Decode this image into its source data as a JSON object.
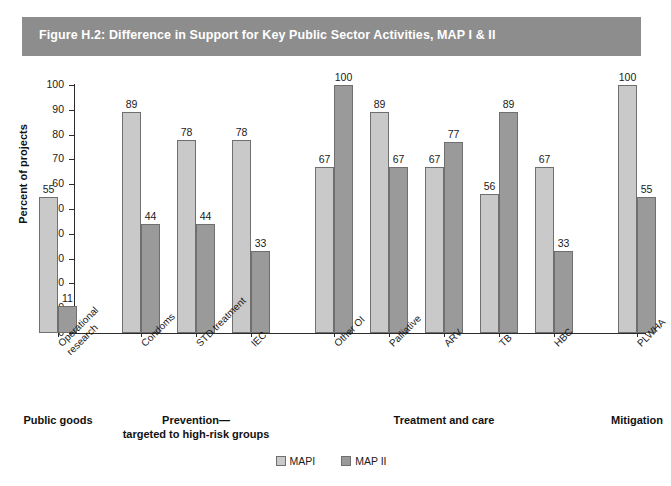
{
  "figure": {
    "title": "Figure H.2: Difference in Support for Key Public Sector Activities, MAP I & II",
    "band_color": "#8d8d8d",
    "title_color": "#ffffff"
  },
  "chart_data": {
    "type": "bar",
    "title": "Figure H.2: Difference in Support for Key Public Sector Activities, MAP I & II",
    "xlabel": "",
    "ylabel": "Percent of projects",
    "ylim": [
      0,
      100
    ],
    "yticks": [
      0,
      10,
      20,
      30,
      40,
      50,
      60,
      70,
      80,
      90,
      100
    ],
    "grid": false,
    "legend_position": "bottom-center",
    "categories": [
      "Operational research",
      "Condoms",
      "STD treatment",
      "IEC",
      "Other OI",
      "Palliative",
      "ARV",
      "TB",
      "HBC",
      "PLWHA"
    ],
    "series": [
      {
        "name": "MAPI",
        "color": "#c9c9c9",
        "values": [
          55,
          89,
          78,
          78,
          67,
          89,
          67,
          56,
          67,
          100
        ]
      },
      {
        "name": "MAP II",
        "color": "#9a9a9a",
        "values": [
          11,
          44,
          44,
          33,
          100,
          67,
          77,
          89,
          33,
          55
        ]
      }
    ],
    "groups": [
      {
        "label": "Public goods",
        "categories": [
          "Operational research"
        ]
      },
      {
        "label": "Prevention—\ntargeted to high-risk groups",
        "categories": [
          "Condoms",
          "STD treatment",
          "IEC"
        ]
      },
      {
        "label": "Treatment and care",
        "categories": [
          "Other OI",
          "Palliative",
          "ARV",
          "TB",
          "HBC"
        ]
      },
      {
        "label": "Mitigation",
        "categories": [
          "PLWHA"
        ]
      }
    ]
  },
  "legend": {
    "items": [
      {
        "label": "MAPI",
        "color": "#c9c9c9"
      },
      {
        "label": "MAP II",
        "color": "#9a9a9a"
      }
    ]
  }
}
